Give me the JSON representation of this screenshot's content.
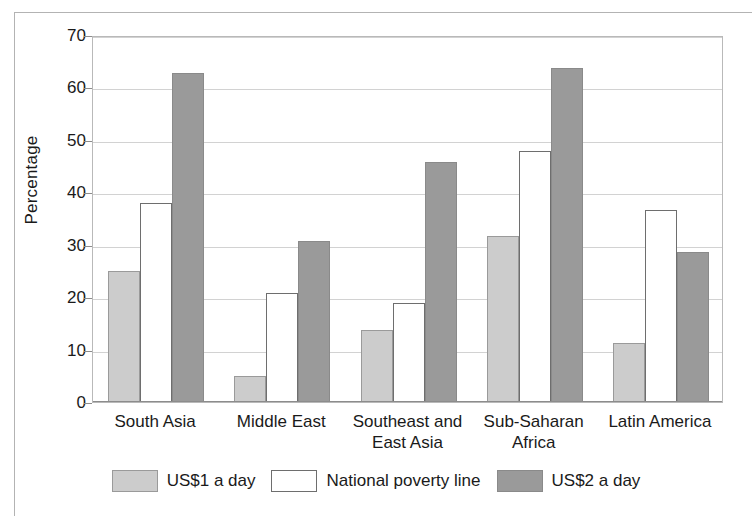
{
  "chart_data": {
    "type": "bar",
    "title": "",
    "subtitle": "",
    "xlabel": "",
    "ylabel": "Percentage",
    "ylim": [
      0,
      70
    ],
    "ytick_step": 10,
    "yticks": [
      0,
      10,
      20,
      30,
      40,
      50,
      60,
      70
    ],
    "ytick_labels": [
      "0",
      "10",
      "20",
      "30",
      "40",
      "50",
      "60",
      "70"
    ],
    "grid": true,
    "grid_axis": "y",
    "legend_position": "bottom-center",
    "categories": [
      "South Asia",
      "Middle East",
      "Southeast and\nEast Asia",
      "Sub-Saharan\nAfrica",
      "Latin America"
    ],
    "series": [
      {
        "name": "US$1 a day",
        "color": "#cccccc",
        "edge_color": "#9a9a9a",
        "values": [
          24.9,
          4.9,
          13.8,
          31.7,
          11.2
        ]
      },
      {
        "name": "National poverty line",
        "color": "#ffffff",
        "edge_color": "#6e6e6e",
        "values": [
          37.9,
          20.8,
          18.8,
          47.8,
          36.7
        ]
      },
      {
        "name": "US$2 a day",
        "color": "#9a9a9a",
        "edge_color": "#8a8a8a",
        "values": [
          62.8,
          30.8,
          45.7,
          63.7,
          28.7
        ]
      }
    ],
    "annotations": []
  },
  "legend": {
    "items": [
      {
        "label": "US$1 a day",
        "swatch": "light-gray-swatch"
      },
      {
        "label": "National poverty line",
        "swatch": "white-swatch"
      },
      {
        "label": "US$2 a day",
        "swatch": "dark-gray-swatch"
      }
    ]
  },
  "colors": {
    "series_1": "#cccccc",
    "series_2": "#ffffff",
    "series_3": "#9a9a9a",
    "gridline": "#d2d2d2",
    "axis": "#8c8c8c",
    "border": "#b3b3b3",
    "text": "#1a1a1a",
    "background": "#ffffff"
  }
}
